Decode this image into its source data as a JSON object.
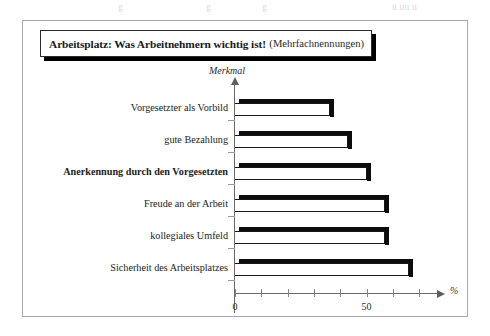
{
  "top_bleed": {
    "fragments": [
      {
        "text": "g",
        "left": 118
      },
      {
        "text": "g",
        "left": 206
      },
      {
        "text": "g",
        "left": 262
      },
      {
        "text": "u  uu  u",
        "left": 392
      }
    ]
  },
  "title": {
    "main": "Arbeitsplatz: Was Arbeitnehmern wichtig ist!",
    "sub": "(Mehrfachnennungen)"
  },
  "axes": {
    "y_title": "Merkmal",
    "x_title": "%"
  },
  "chart_data": {
    "type": "bar",
    "orientation": "horizontal",
    "title": "Arbeitsplatz: Was Arbeitnehmern wichtig ist! (Mehrfachnennungen)",
    "xlabel": "%",
    "ylabel": "Merkmal",
    "xlim": [
      0,
      75
    ],
    "grid": false,
    "legend": false,
    "tick_values": [
      0,
      10,
      20,
      30,
      40,
      50,
      60,
      70
    ],
    "tick_labels": [
      "0",
      "",
      "",
      "",
      "",
      "50",
      "",
      ""
    ],
    "categories": [
      "Vorgesetzter als Vorbild",
      "gute Bezahlung",
      "Anerkennung durch den Vorgesetzten",
      "Freude an der Arbeit",
      "kollegiales Umfeld",
      "Sicherheit des Arbeitsplatzes"
    ],
    "values": [
      36,
      43,
      50,
      57,
      57,
      66
    ],
    "emphasized_category": "Anerkennung durch den Vorgesetzten"
  },
  "colors": {
    "bar_fill": "#ffffff",
    "bar_edge": "#0c0c0c",
    "axis": "#6a6a70",
    "frame": "#a7a7ad",
    "text": "#1a1a1a"
  }
}
